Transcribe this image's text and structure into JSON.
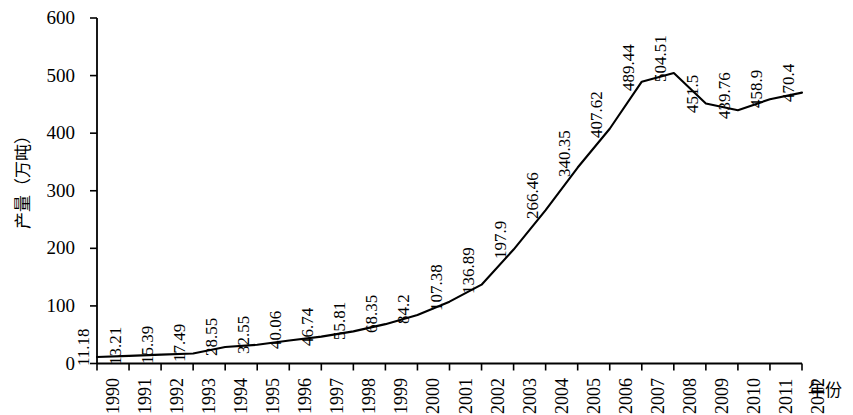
{
  "chart_data": {
    "type": "line",
    "title": "",
    "subtitle": "",
    "xlabel": "年份",
    "ylabel": "产量（万吨）",
    "categories": [
      "1990",
      "1991",
      "1992",
      "1993",
      "1994",
      "1995",
      "1996",
      "1997",
      "1998",
      "1999",
      "2000",
      "2001",
      "2002",
      "2003",
      "2004",
      "2005",
      "2006",
      "2007",
      "2008",
      "2009",
      "2010",
      "2011",
      "2012"
    ],
    "values": [
      11.18,
      13.21,
      15.39,
      17.49,
      28.55,
      32.55,
      40.06,
      46.74,
      55.81,
      68.35,
      84.2,
      107.38,
      136.89,
      197.9,
      266.46,
      340.35,
      407.62,
      489.44,
      504.51,
      451.5,
      439.76,
      458.9,
      470.4
    ],
    "point_labels": [
      "11.18",
      "13.21",
      "15.39",
      "17.49",
      "28.55",
      "32.55",
      "40.06",
      "46.74",
      "55.81",
      "68.35",
      "84.2",
      "107.38",
      "136.89",
      "197.9",
      "266.46",
      "340.35",
      "407.62",
      "489.44",
      "504.51",
      "451.5",
      "439.76",
      "458.9",
      "470.4"
    ],
    "ylim": [
      0,
      600
    ],
    "yticks": [
      0,
      100,
      200,
      300,
      400,
      500,
      600
    ],
    "ytick_labels": [
      "0",
      "100",
      "200",
      "300",
      "400",
      "500",
      "600"
    ],
    "xtick_labels": [
      "1990",
      "1991",
      "1992",
      "1993",
      "1994",
      "1995",
      "1996",
      "1997",
      "1998",
      "1999",
      "2000",
      "2001",
      "2002",
      "2003",
      "2004",
      "2005",
      "2006",
      "2007",
      "2008",
      "2009",
      "2010",
      "2011",
      "2012"
    ],
    "grid": false,
    "legend": null,
    "line_color": "#000000",
    "axis_color": "#000000",
    "background_color": "#ffffff",
    "label_rotation_deg": 90
  }
}
